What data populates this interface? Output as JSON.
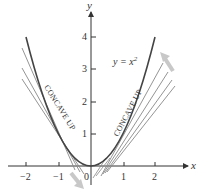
{
  "diagram": {
    "curve_label": "y = x",
    "curve_exponent": "2",
    "axes": {
      "x_label": "x",
      "y_label": "y",
      "x_ticks": [
        "−2",
        "−1",
        "0",
        "1",
        "2"
      ],
      "y_ticks": [
        "1",
        "2",
        "3",
        "4"
      ]
    },
    "annotations": {
      "left": "CONCAVE UP",
      "right": "CONCAVE UP"
    },
    "colors": {
      "curve": "#444444",
      "tangent": "#888888",
      "axis": "#333333",
      "arrow": "#c8c8c8"
    }
  }
}
